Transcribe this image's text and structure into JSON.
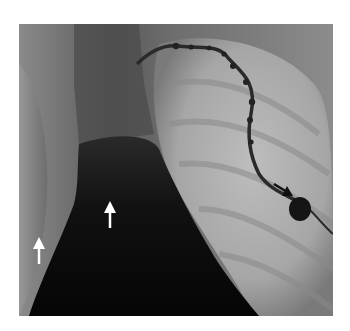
{
  "figure": {
    "type": "radiograph",
    "annotations": [
      {
        "id": "white-arrow-left",
        "color": "#ffffff",
        "direction": "up"
      },
      {
        "id": "white-arrow-center",
        "color": "#ffffff",
        "direction": "up"
      },
      {
        "id": "black-arrow-right",
        "color": "#111111",
        "direction": "down-right"
      }
    ],
    "colors": {
      "background": "#ffffff",
      "dark_region": "#0a0a0a",
      "mid_gray": "#6a6a6a",
      "light_region": "#b8b8b8",
      "device": "#151515"
    }
  }
}
